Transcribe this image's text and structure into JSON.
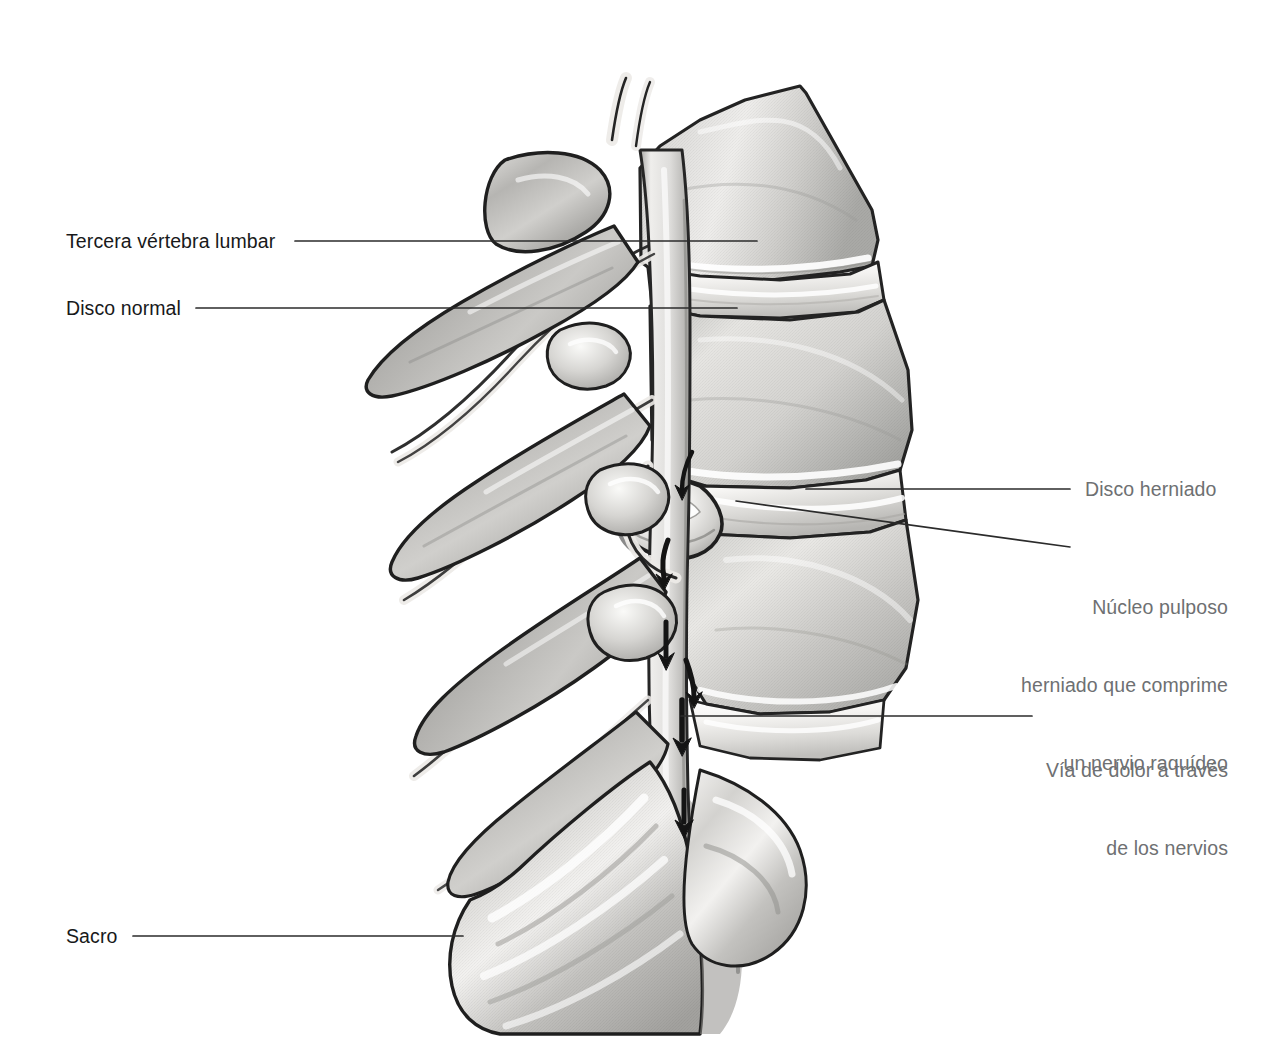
{
  "figure": {
    "background_color": "#ffffff",
    "ink_color": "#1a1a1a",
    "bone_tone_light": "#f3f3f2",
    "bone_tone_mid": "#c9c9c7",
    "bone_tone_dark": "#9a9a98",
    "nerve_tone": "#e9e8e6",
    "label_color_dark": "#18191a",
    "label_color_gray": "#6e7072",
    "leader_color": "#2b2b2b"
  },
  "labels": {
    "third_lumbar_vertebra": {
      "text": "Tercera vértebra lumbar",
      "align": "left",
      "tone": "dark",
      "x": 66,
      "y": 228,
      "leader": {
        "x1": 295,
        "y1": 241,
        "x2": 757,
        "y2": 241
      }
    },
    "normal_disc": {
      "text": "Disco normal",
      "align": "left",
      "tone": "dark",
      "x": 66,
      "y": 295,
      "leader": {
        "x1": 196,
        "y1": 308,
        "x2": 737,
        "y2": 308
      }
    },
    "herniated_disc": {
      "text": "Disco herniado",
      "align": "left",
      "tone": "gray",
      "x": 1085,
      "y": 476,
      "leader": {
        "x1": 806,
        "y1": 489,
        "x2": 1070,
        "y2": 489
      }
    },
    "herniated_nucleus": {
      "line1": "Núcleo pulposo",
      "line2": "herniado que comprime",
      "line3": "un nervio raquídeo",
      "align": "right",
      "tone": "gray",
      "x_right": 1228,
      "y": 542,
      "leader": {
        "x1": 736,
        "y1": 501,
        "x2": 1070,
        "y2": 547
      }
    },
    "pain_pathway": {
      "line1": "Vía de dolor a través",
      "line2": "de los nervios",
      "align": "right",
      "tone": "gray",
      "x_right": 1228,
      "y": 705,
      "leader": {
        "x1": 681,
        "y1": 716,
        "x2": 1032,
        "y2": 716
      }
    },
    "sacrum": {
      "text": "Sacro",
      "align": "left",
      "tone": "dark",
      "x": 66,
      "y": 923,
      "leader": {
        "x1": 133,
        "y1": 936,
        "x2": 463,
        "y2": 936
      }
    }
  },
  "anatomy": {
    "structures": [
      {
        "name": "tercera-vertebra-lumbar",
        "label": "Tercera vértebra lumbar"
      },
      {
        "name": "disco-normal",
        "label": "Disco normal"
      },
      {
        "name": "disco-herniado",
        "label": "Disco herniado"
      },
      {
        "name": "nucleo-pulposo-herniado",
        "label": "Núcleo pulposo herniado"
      },
      {
        "name": "nervio-raquideo-comprimido",
        "label": "Nervio raquídeo comprimido"
      },
      {
        "name": "cauda-equina",
        "label": "Cola de caballo"
      },
      {
        "name": "apofisis-espinosa",
        "label": "Apófisis espinosa"
      },
      {
        "name": "sacro",
        "label": "Sacro"
      }
    ],
    "pain_arrow_count": 6,
    "vertebral_body_count": 4,
    "spinous_process_count": 4
  }
}
